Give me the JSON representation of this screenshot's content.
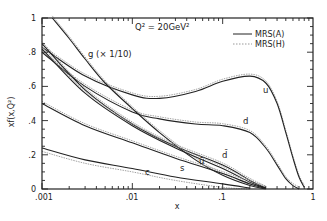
{
  "chart_data": {
    "type": "line",
    "title": "",
    "annotation": "Q² = 20GeV²",
    "xlabel": "x",
    "ylabel": "xf(x,Q²)",
    "xscale": "log",
    "xlim": [
      0.001,
      1
    ],
    "ylim": [
      0,
      1
    ],
    "xticks": [
      ".001",
      ".01",
      ".1",
      "1"
    ],
    "yticks": [
      "0",
      ".2",
      ".4",
      ".6",
      ".8",
      "1"
    ],
    "grid": false,
    "legend": {
      "position": "upper right",
      "entries": [
        {
          "label": "MRS(A)",
          "style": "solid"
        },
        {
          "label": "MRS(H)",
          "style": "dotted"
        }
      ]
    },
    "series": [
      {
        "name": "u",
        "label": "u",
        "set": "MRS(A)",
        "x": [
          0.001,
          0.003,
          0.01,
          0.02,
          0.05,
          0.1,
          0.2,
          0.3,
          0.4,
          0.5,
          0.6,
          0.7,
          0.8
        ],
        "y": [
          0.83,
          0.66,
          0.55,
          0.53,
          0.57,
          0.63,
          0.66,
          0.62,
          0.5,
          0.33,
          0.18,
          0.07,
          0.01
        ]
      },
      {
        "name": "d",
        "label": "d",
        "set": "MRS(A)",
        "x": [
          0.001,
          0.003,
          0.01,
          0.02,
          0.05,
          0.1,
          0.2,
          0.3,
          0.4,
          0.5,
          0.6,
          0.7
        ],
        "y": [
          0.8,
          0.6,
          0.45,
          0.41,
          0.38,
          0.37,
          0.33,
          0.24,
          0.14,
          0.06,
          0.02,
          0.0
        ]
      },
      {
        "name": "g",
        "label": "g (× 1/10)",
        "set": "MRS(A)",
        "x": [
          0.0013,
          0.002,
          0.003,
          0.005,
          0.01,
          0.02,
          0.05,
          0.1,
          0.2,
          0.3
        ],
        "y": [
          1.0,
          0.88,
          0.76,
          0.62,
          0.47,
          0.33,
          0.17,
          0.08,
          0.02,
          0.0
        ]
      },
      {
        "name": "dbar",
        "label": "d̄",
        "set": "MRS(A)",
        "x": [
          0.001,
          0.003,
          0.01,
          0.03,
          0.1,
          0.2,
          0.3
        ],
        "y": [
          0.85,
          0.58,
          0.38,
          0.25,
          0.14,
          0.05,
          0.005
        ]
      },
      {
        "name": "ubar",
        "label": "ū",
        "set": "MRS(A)",
        "x": [
          0.001,
          0.003,
          0.01,
          0.03,
          0.1,
          0.2,
          0.3
        ],
        "y": [
          0.82,
          0.56,
          0.37,
          0.24,
          0.12,
          0.04,
          0.005
        ]
      },
      {
        "name": "s",
        "label": "s",
        "set": "MRS(A)",
        "x": [
          0.001,
          0.003,
          0.01,
          0.03,
          0.1,
          0.2,
          0.3
        ],
        "y": [
          0.5,
          0.37,
          0.27,
          0.18,
          0.09,
          0.03,
          0.003
        ]
      },
      {
        "name": "c",
        "label": "c",
        "set": "MRS(A)",
        "x": [
          0.001,
          0.003,
          0.01,
          0.03,
          0.1,
          0.2
        ],
        "y": [
          0.24,
          0.17,
          0.12,
          0.07,
          0.03,
          0.005
        ]
      }
    ],
    "series_mrsh_offset_note": "MRS(H) dotted curves closely follow MRS(A) with slight offsets"
  },
  "labels": {
    "annotation": "Q² = 20GeV²",
    "xlabel": "x",
    "ylabel": "xf(x,Q²)",
    "g_label": "g (× 1/10)",
    "legend_a": "MRS(A)",
    "legend_h": "MRS(H)",
    "curve_u": "u",
    "curve_d": "d",
    "curve_dbar": "d̄",
    "curve_ubar": "ū",
    "curve_s": "s",
    "curve_c": "c",
    "xtick_0": ".001",
    "xtick_1": ".01",
    "xtick_2": ".1",
    "xtick_3": "1",
    "ytick_0": "0",
    "ytick_1": ".2",
    "ytick_2": ".4",
    "ytick_3": ".6",
    "ytick_4": ".8",
    "ytick_5": "1"
  }
}
